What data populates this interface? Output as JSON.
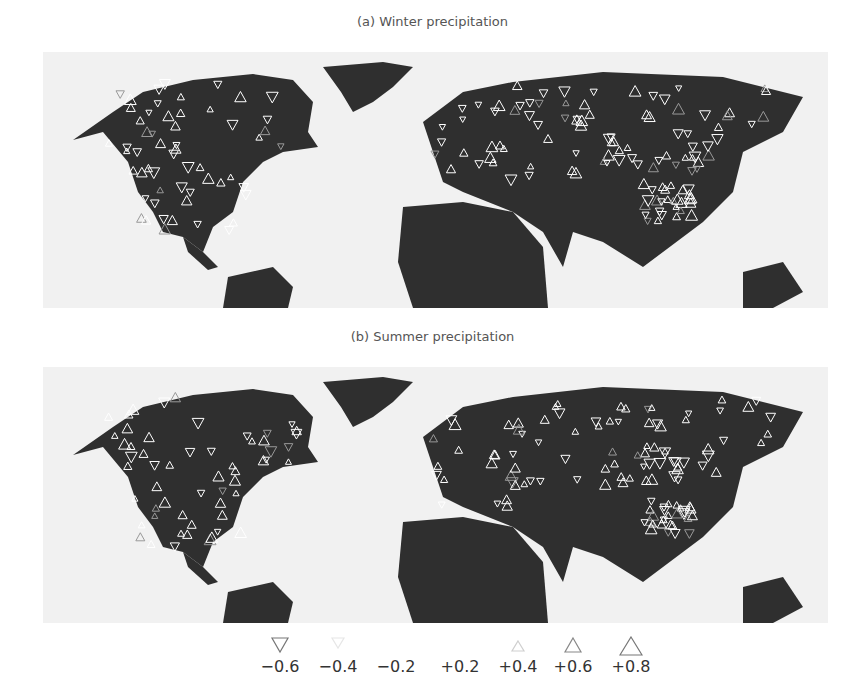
{
  "figure": {
    "panels": [
      {
        "id": "a",
        "title": "(a) Winter precipitation"
      },
      {
        "id": "b",
        "title": "(b) Summer precipitation"
      }
    ],
    "colors": {
      "land": "#2f2f2f",
      "ocean": "#f1f1f1",
      "marker_stroke": "#ffffff",
      "marker_positive_strong": "#8a8a8a"
    },
    "legend": {
      "items": [
        {
          "label": "−0.6",
          "value": -0.6,
          "symbol": "triangle-down",
          "color": "#777777"
        },
        {
          "label": "−0.4",
          "value": -0.4,
          "symbol": "triangle-down",
          "color": "#e6e6e6"
        },
        {
          "label": "−0.2",
          "value": -0.2,
          "symbol": "triangle-down",
          "color": "#ffffff"
        },
        {
          "label": "+0.2",
          "value": 0.2,
          "symbol": "triangle-up",
          "color": "#ffffff"
        },
        {
          "label": "+0.4",
          "value": 0.4,
          "symbol": "triangle-up",
          "color": "#cfcfcf"
        },
        {
          "label": "+0.6",
          "value": 0.6,
          "symbol": "triangle-up",
          "color": "#888888"
        },
        {
          "label": "+0.8",
          "value": 0.8,
          "symbol": "triangle-up",
          "color": "#777777"
        }
      ]
    }
  }
}
